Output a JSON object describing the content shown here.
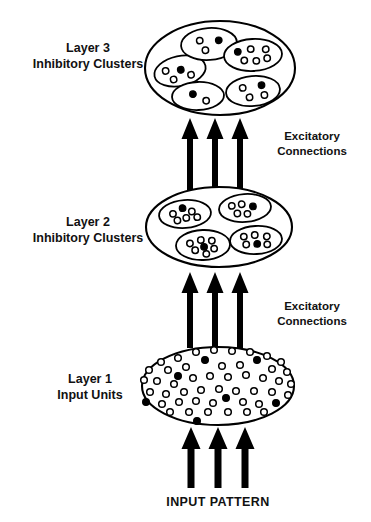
{
  "figure": {
    "background_color": "#ffffff",
    "stroke_color": "#000000"
  },
  "labels": {
    "layer3_line1": "Layer 3",
    "layer3_line2": "Inhibitory Clusters",
    "layer2_line1": "Layer 2",
    "layer2_line2": "Inhibitory Clusters",
    "layer1_line1": "Layer 1",
    "layer1_line2": "Input Units",
    "excitatory_upper_line1": "Excitatory",
    "excitatory_upper_line2": "Connections",
    "excitatory_lower_line1": "Excitatory",
    "excitatory_lower_line2": "Connections",
    "input_pattern": "INPUT PATTERN"
  },
  "layers": {
    "layer3": {
      "name": "Layer 3",
      "ellipse": {
        "cx": 220,
        "cy": 68,
        "rx": 75,
        "ry": 47
      },
      "cluster_count": 5,
      "clusters": [
        {
          "id": "l3-cluster-left",
          "ellipse": {
            "cx": 180,
            "cy": 71,
            "rx": 26,
            "ry": 15,
            "rot": -12
          },
          "units": [
            {
              "x": -14,
              "y": -3,
              "filled": false
            },
            {
              "x": 1,
              "y": -1,
              "filled": true
            },
            {
              "x": -8,
              "y": 7,
              "filled": false
            },
            {
              "x": 10,
              "y": 6,
              "filled": false
            }
          ]
        },
        {
          "id": "l3-cluster-top",
          "ellipse": {
            "cx": 209,
            "cy": 44,
            "rx": 28,
            "ry": 16,
            "rot": -4
          },
          "units": [
            {
              "x": -9,
              "y": -4,
              "filled": false
            },
            {
              "x": 10,
              "y": -3,
              "filled": true
            },
            {
              "x": -4,
              "y": 6,
              "filled": false
            }
          ]
        },
        {
          "id": "l3-cluster-right-upper",
          "ellipse": {
            "cx": 253,
            "cy": 55,
            "rx": 29,
            "ry": 16,
            "rot": -3
          },
          "units": [
            {
              "x": -15,
              "y": -4,
              "filled": true
            },
            {
              "x": -2,
              "y": -6,
              "filled": false
            },
            {
              "x": 13,
              "y": -5,
              "filled": false
            },
            {
              "x": -9,
              "y": 5,
              "filled": false
            },
            {
              "x": 3,
              "y": 6,
              "filled": false
            },
            {
              "x": 14,
              "y": 4,
              "filled": false
            }
          ]
        },
        {
          "id": "l3-cluster-right-lower",
          "ellipse": {
            "cx": 253,
            "cy": 91,
            "rx": 27,
            "ry": 15,
            "rot": -5
          },
          "units": [
            {
              "x": -10,
              "y": -4,
              "filled": false
            },
            {
              "x": 9,
              "y": -5,
              "filled": true
            },
            {
              "x": -4,
              "y": 6,
              "filled": false
            },
            {
              "x": 11,
              "y": 5,
              "filled": false
            }
          ]
        },
        {
          "id": "l3-cluster-bottom",
          "ellipse": {
            "cx": 198,
            "cy": 96,
            "rx": 26,
            "ry": 14,
            "rot": -2
          },
          "units": [
            {
              "x": -5,
              "y": -2,
              "filled": true
            },
            {
              "x": 8,
              "y": 5,
              "filled": false
            }
          ]
        }
      ]
    },
    "layer2": {
      "name": "Layer 2",
      "ellipse": {
        "cx": 219,
        "cy": 227,
        "rx": 73,
        "ry": 40
      },
      "cluster_count": 4,
      "clusters": [
        {
          "id": "l2-cluster-top-left",
          "ellipse": {
            "cx": 185,
            "cy": 214,
            "rx": 26,
            "ry": 14,
            "rot": -4
          },
          "units": [
            {
              "x": -12,
              "y": -1,
              "filled": false
            },
            {
              "x": -2,
              "y": -6,
              "filled": true
            },
            {
              "x": 7,
              "y": -2,
              "filled": false
            },
            {
              "x": -8,
              "y": 6,
              "filled": false
            },
            {
              "x": 1,
              "y": 4,
              "filled": false
            },
            {
              "x": 12,
              "y": 4,
              "filled": false
            }
          ]
        },
        {
          "id": "l2-cluster-top-right",
          "ellipse": {
            "cx": 245,
            "cy": 208,
            "rx": 26,
            "ry": 14,
            "rot": -4
          },
          "units": [
            {
              "x": -13,
              "y": -3,
              "filled": false
            },
            {
              "x": -3,
              "y": -4,
              "filled": false
            },
            {
              "x": 8,
              "y": -1,
              "filled": true
            },
            {
              "x": -8,
              "y": 5,
              "filled": false
            },
            {
              "x": 2,
              "y": 6,
              "filled": false
            }
          ]
        },
        {
          "id": "l2-cluster-bottom-left",
          "ellipse": {
            "cx": 203,
            "cy": 245,
            "rx": 27,
            "ry": 15,
            "rot": -2
          },
          "units": [
            {
              "x": -13,
              "y": -2,
              "filled": false
            },
            {
              "x": -2,
              "y": -5,
              "filled": false
            },
            {
              "x": 9,
              "y": -4,
              "filled": false
            },
            {
              "x": -8,
              "y": 5,
              "filled": false
            },
            {
              "x": 1,
              "y": 2,
              "filled": true
            },
            {
              "x": 11,
              "y": 4,
              "filled": false
            },
            {
              "x": 3,
              "y": 9,
              "filled": false
            }
          ]
        },
        {
          "id": "l2-cluster-bottom-right",
          "ellipse": {
            "cx": 256,
            "cy": 240,
            "rx": 26,
            "ry": 14,
            "rot": -3
          },
          "units": [
            {
              "x": -12,
              "y": -4,
              "filled": false
            },
            {
              "x": -1,
              "y": -5,
              "filled": false
            },
            {
              "x": 11,
              "y": -3,
              "filled": false
            },
            {
              "x": -10,
              "y": 4,
              "filled": false
            },
            {
              "x": 1,
              "y": 4,
              "filled": true
            },
            {
              "x": 11,
              "y": 5,
              "filled": false
            }
          ]
        }
      ]
    },
    "layer1": {
      "name": "Layer 1",
      "ellipse": {
        "cx": 218,
        "cy": 386,
        "rx": 76,
        "ry": 39
      },
      "unit_count": 52,
      "units": [
        {
          "x": 196,
          "y": 352,
          "filled": false
        },
        {
          "x": 214,
          "y": 350,
          "filled": false
        },
        {
          "x": 232,
          "y": 351,
          "filled": false
        },
        {
          "x": 250,
          "y": 352,
          "filled": false
        },
        {
          "x": 267,
          "y": 356,
          "filled": false
        },
        {
          "x": 178,
          "y": 358,
          "filled": false
        },
        {
          "x": 161,
          "y": 362,
          "filled": false
        },
        {
          "x": 281,
          "y": 362,
          "filled": false
        },
        {
          "x": 205,
          "y": 360,
          "filled": true
        },
        {
          "x": 257,
          "y": 360,
          "filled": true
        },
        {
          "x": 149,
          "y": 370,
          "filled": false
        },
        {
          "x": 168,
          "y": 370,
          "filled": false
        },
        {
          "x": 186,
          "y": 367,
          "filled": false
        },
        {
          "x": 222,
          "y": 366,
          "filled": false
        },
        {
          "x": 240,
          "y": 365,
          "filled": false
        },
        {
          "x": 272,
          "y": 369,
          "filled": false
        },
        {
          "x": 287,
          "y": 372,
          "filled": false
        },
        {
          "x": 178,
          "y": 376,
          "filled": true
        },
        {
          "x": 144,
          "y": 380,
          "filled": false
        },
        {
          "x": 157,
          "y": 381,
          "filled": false
        },
        {
          "x": 174,
          "y": 384,
          "filled": false
        },
        {
          "x": 193,
          "y": 378,
          "filled": false
        },
        {
          "x": 210,
          "y": 376,
          "filled": false
        },
        {
          "x": 228,
          "y": 377,
          "filled": false
        },
        {
          "x": 246,
          "y": 375,
          "filled": false
        },
        {
          "x": 263,
          "y": 378,
          "filled": false
        },
        {
          "x": 279,
          "y": 381,
          "filled": false
        },
        {
          "x": 291,
          "y": 384,
          "filled": false
        },
        {
          "x": 150,
          "y": 392,
          "filled": false
        },
        {
          "x": 166,
          "y": 394,
          "filled": false
        },
        {
          "x": 184,
          "y": 392,
          "filled": false
        },
        {
          "x": 201,
          "y": 390,
          "filled": false
        },
        {
          "x": 219,
          "y": 389,
          "filled": false
        },
        {
          "x": 236,
          "y": 391,
          "filled": false
        },
        {
          "x": 254,
          "y": 391,
          "filled": false
        },
        {
          "x": 272,
          "y": 392,
          "filled": false
        },
        {
          "x": 288,
          "y": 395,
          "filled": false
        },
        {
          "x": 146,
          "y": 402,
          "filled": true
        },
        {
          "x": 226,
          "y": 398,
          "filled": true
        },
        {
          "x": 276,
          "y": 403,
          "filled": true
        },
        {
          "x": 162,
          "y": 404,
          "filled": false
        },
        {
          "x": 179,
          "y": 402,
          "filled": false
        },
        {
          "x": 196,
          "y": 401,
          "filled": false
        },
        {
          "x": 213,
          "y": 403,
          "filled": false
        },
        {
          "x": 243,
          "y": 402,
          "filled": false
        },
        {
          "x": 259,
          "y": 404,
          "filled": false
        },
        {
          "x": 170,
          "y": 412,
          "filled": false
        },
        {
          "x": 189,
          "y": 412,
          "filled": false
        },
        {
          "x": 208,
          "y": 412,
          "filled": false
        },
        {
          "x": 228,
          "y": 412,
          "filled": false
        },
        {
          "x": 247,
          "y": 412,
          "filled": false
        },
        {
          "x": 264,
          "y": 412,
          "filled": false
        },
        {
          "x": 197,
          "y": 421,
          "filled": true
        }
      ]
    }
  },
  "connections": {
    "upper_group": {
      "name": "layer2-to-layer3-arrows",
      "arrow_count": 3,
      "arrow_x": [
        190,
        215,
        240
      ],
      "y_top": 118,
      "y_bottom": 190
    },
    "lower_group": {
      "name": "layer1-to-layer2-arrows",
      "arrow_count": 3,
      "arrow_x": [
        190,
        215,
        240
      ],
      "y_top": 272,
      "y_bottom": 348
    },
    "input_group": {
      "name": "input-to-layer1-arrows",
      "arrow_count": 3,
      "arrow_x": [
        191,
        218,
        245
      ],
      "y_top": 427,
      "y_bottom": 488
    }
  },
  "text_positions": {
    "layer3_x": 88,
    "layer3_y": 52,
    "layer2_x": 88,
    "layer2_y": 226,
    "layer1_x": 90,
    "layer1_y": 383,
    "exc_upper_x": 312,
    "exc_upper_y": 140,
    "exc_lower_x": 312,
    "exc_lower_y": 310,
    "input_x": 218,
    "input_y": 506
  }
}
